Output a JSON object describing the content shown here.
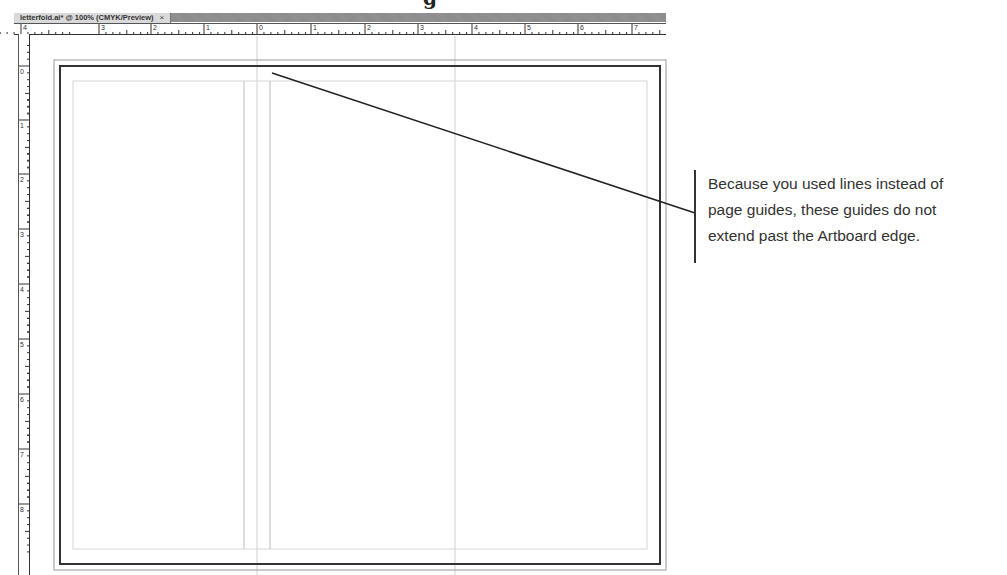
{
  "page": {
    "partial_heading_fragment": "g"
  },
  "window": {
    "tab": {
      "title": "letterfold.ai* @ 100% (CMYK/Preview)",
      "close_label": "×"
    },
    "horizontal_ruler": {
      "labels": [
        "4",
        "3",
        "2",
        "1",
        "0",
        "1",
        "2",
        "3",
        "4",
        "5",
        "6",
        "7"
      ],
      "label_x": [
        21,
        99,
        151,
        204,
        257,
        311,
        365,
        418,
        472,
        525,
        578,
        632
      ]
    },
    "vertical_ruler": {
      "labels": [
        "0",
        "1",
        "2",
        "3",
        "4",
        "5",
        "6",
        "7",
        "8"
      ],
      "label_y": [
        75,
        129,
        183,
        238,
        293,
        348,
        403,
        458,
        513
      ]
    },
    "artboard": {
      "bleed_rect": {
        "x": 54,
        "y": 60,
        "w": 612,
        "h": 510
      },
      "trim_rect": {
        "x": 60,
        "y": 66,
        "w": 600,
        "h": 498
      },
      "margin_rect": {
        "x": 73,
        "y": 81,
        "w": 574,
        "h": 468
      },
      "page_guides_x": [
        257,
        455
      ],
      "line_guides_x": [
        244,
        270
      ]
    },
    "colors": {
      "tab_bg": "#d9d9d9",
      "tabbar_bg": "#8a8a8a",
      "trim": "#333333",
      "bleed": "#999999",
      "guide": "#cfcfcf",
      "leader": "#222222"
    }
  },
  "annotation": {
    "text": "Because you used lines instead of page guides, these guides do not extend past the Artboard edge.",
    "lines": [
      "Because you used lines instead of",
      "page guides, these guides do not",
      "extend past the Artboard edge."
    ],
    "leader": {
      "x1": 272,
      "y1": 73,
      "x2": 695,
      "y2": 213
    }
  }
}
